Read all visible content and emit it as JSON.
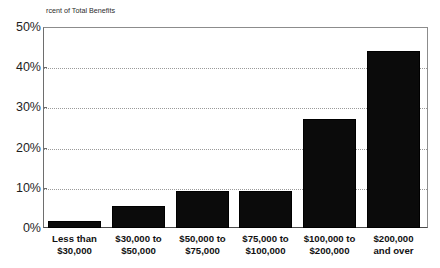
{
  "chart_data": {
    "type": "bar",
    "title": "",
    "clipped_title_remnant": "",
    "xlabel": "",
    "ylabel": "rcent of Total Benefits",
    "ylabel_full": "Percent of Total Benefits",
    "categories": [
      "Less than\n$30,000",
      "$30,000 to\n$50,000",
      "$50,000 to\n$75,000",
      "$75,000 to\n$100,000",
      "$100,000 to\n$200,000",
      "$200,000\nand over"
    ],
    "values": [
      1.7,
      5.5,
      9.1,
      9.2,
      27.0,
      44.0
    ],
    "ylim": [
      0,
      50
    ],
    "yticks": [
      0,
      10,
      20,
      30,
      40,
      50
    ],
    "ytick_labels": [
      "0%",
      "10%",
      "20%",
      "30%",
      "40%",
      "50%"
    ],
    "grid": true,
    "grid_style": "dotted-horizontal",
    "legend": "none",
    "bar_color": "#0b0b0b",
    "plot_background": "#ffffff"
  }
}
